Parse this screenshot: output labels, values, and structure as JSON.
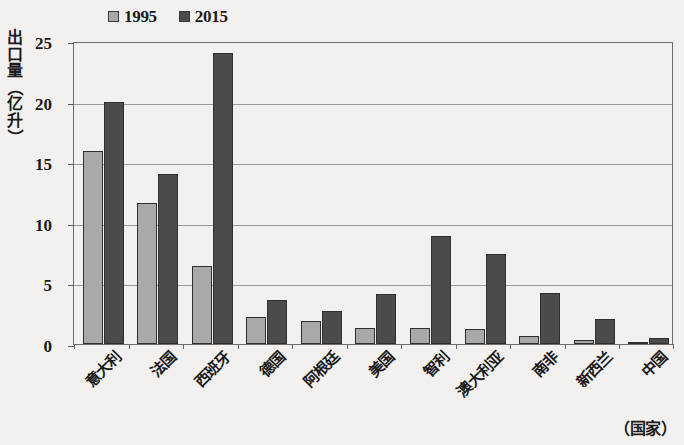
{
  "chart_data": {
    "type": "bar",
    "title": "",
    "subtitle": "",
    "xlabel": "（国家）",
    "ylabel": "出口量（亿升）",
    "ylabel_chars": [
      "出",
      "口",
      "量",
      "（",
      "亿",
      "升",
      "）"
    ],
    "categories": [
      "意大利",
      "法国",
      "西班牙",
      "德国",
      "阿根廷",
      "美国",
      "智利",
      "澳大利亚",
      "南非",
      "新西兰",
      "中国"
    ],
    "series": [
      {
        "name": "1995",
        "color": "#a9a9a9",
        "values": [
          15.9,
          11.6,
          6.4,
          2.2,
          1.9,
          1.3,
          1.3,
          1.2,
          0.7,
          0.3,
          0.15
        ]
      },
      {
        "name": "2015",
        "color": "#4b4b4b",
        "values": [
          20.0,
          14.0,
          24.0,
          3.6,
          2.7,
          4.1,
          8.9,
          7.4,
          4.2,
          2.1,
          0.5
        ]
      }
    ],
    "ylim": [
      0,
      25
    ],
    "ytick_values": [
      0,
      5,
      10,
      15,
      20,
      25
    ],
    "ytick_labels": [
      "0",
      "5",
      "10",
      "15",
      "20",
      "25"
    ],
    "grid": true,
    "grid_axis": "y",
    "legend_position": "top-left",
    "bar_edge_color": "#2f2f2f",
    "axis_color": "#6d6d6d"
  },
  "legend": {
    "entries": [
      {
        "label": "1995",
        "swatch_color": "#a9a9a9"
      },
      {
        "label": "2015",
        "swatch_color": "#4b4b4b"
      }
    ]
  }
}
